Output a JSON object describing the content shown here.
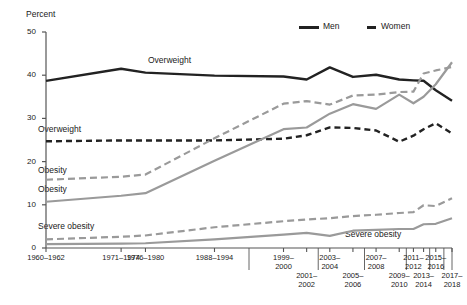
{
  "chart_data": {
    "type": "line",
    "title": "",
    "xlabel": "",
    "ylabel": "Percent",
    "ylim": [
      0,
      50
    ],
    "yticks": [
      0,
      10,
      20,
      30,
      40,
      50
    ],
    "grid": false,
    "legend_position": "top-right",
    "categories": [
      "1960–1962",
      "1971–1974",
      "1976–1980",
      "1988–1994",
      "1999–2000",
      "2001–2002",
      "2003–2004",
      "2005–2006",
      "2007–2008",
      "2009–2010",
      "2011–2012",
      "2013–2014",
      "2015–2016",
      "2017–2018"
    ],
    "series": [
      {
        "name": "Men, overweight",
        "sex": "Men",
        "measure": "Overweight",
        "style": "solid",
        "color": "#222222",
        "values": [
          38.7,
          41.5,
          40.6,
          39.9,
          39.7,
          39.0,
          41.8,
          39.6,
          40.1,
          39.0,
          38.8,
          38.7,
          36.5,
          34.1
        ]
      },
      {
        "name": "Women, overweight",
        "sex": "Women",
        "measure": "Overweight",
        "style": "dashed",
        "color": "#222222",
        "values": [
          24.7,
          24.9,
          24.9,
          24.9,
          25.3,
          26.1,
          27.9,
          27.8,
          27.2,
          24.6,
          26.0,
          27.5,
          28.9,
          26.5
        ]
      },
      {
        "name": "Men, obesity",
        "sex": "Men",
        "measure": "Obesity",
        "style": "solid",
        "color": "#9a9a9a",
        "values": [
          10.7,
          12.1,
          12.7,
          20.2,
          27.5,
          27.9,
          31.1,
          33.3,
          32.2,
          35.5,
          33.5,
          35.0,
          37.9,
          43.0
        ]
      },
      {
        "name": "Women, obesity",
        "sex": "Women",
        "measure": "Obesity",
        "style": "dashed",
        "color": "#9a9a9a",
        "values": [
          15.8,
          16.5,
          17.0,
          25.4,
          33.4,
          34.0,
          33.2,
          35.3,
          35.5,
          36.1,
          36.2,
          40.4,
          41.1,
          41.9
        ]
      },
      {
        "name": "Men, severe obesity",
        "sex": "Men",
        "measure": "Severe obesity",
        "style": "solid",
        "color": "#9a9a9a",
        "values": [
          0.9,
          1.0,
          1.1,
          2.0,
          3.1,
          3.5,
          2.8,
          4.0,
          4.2,
          4.4,
          4.4,
          5.5,
          5.6,
          6.9
        ]
      },
      {
        "name": "Women, severe obesity",
        "sex": "Women",
        "measure": "Severe obesity",
        "style": "dashed",
        "color": "#9a9a9a",
        "values": [
          2.0,
          2.6,
          2.9,
          4.8,
          6.2,
          6.6,
          6.9,
          7.4,
          7.7,
          8.1,
          8.3,
          9.9,
          9.7,
          11.5
        ]
      }
    ],
    "annotations": [
      {
        "text": "Overweight",
        "series": "Men, overweight"
      },
      {
        "text": "Overweight",
        "series": "Women, overweight"
      },
      {
        "text": "Obesity",
        "series": "Women, obesity"
      },
      {
        "text": "Obesity",
        "series": "Men, obesity"
      },
      {
        "text": "Severe obesity",
        "series": "Women, severe obesity"
      },
      {
        "text": "Severe obesity",
        "series": "Men, severe obesity"
      }
    ],
    "legend": [
      {
        "label": "Men",
        "style": "solid",
        "color": "#222222"
      },
      {
        "label": "Women",
        "style": "dashed",
        "color": "#222222"
      }
    ]
  },
  "axis": {
    "y_title": "Percent",
    "y_ticks": [
      "0",
      "10",
      "20",
      "30",
      "40",
      "50"
    ],
    "x_ticks_top": [
      "1960–1962",
      "1971–1974",
      "1976–1980",
      "1988–1994",
      "1999–\n2000",
      "2003–\n2004",
      "2007–\n2008",
      "2011–\n2012",
      "2015–\n2016"
    ],
    "x_ticks_bottom": [
      "2001–\n2002",
      "2005–\n2006",
      "2009–\n2010",
      "2013–\n2014",
      "2017–\n2018"
    ]
  },
  "legend": {
    "men_label": "Men",
    "women_label": "Women"
  },
  "series_labels": {
    "overweight_men": "Overweight",
    "overweight_women": "Overweight",
    "obesity_women": "Obesity",
    "obesity_men": "Obesity",
    "severe_obesity_left": "Severe obesity",
    "severe_obesity_right": "Severe obesity"
  },
  "colors": {
    "dark": "#222222",
    "gray": "#9a9a9a",
    "axis": "#555555"
  }
}
